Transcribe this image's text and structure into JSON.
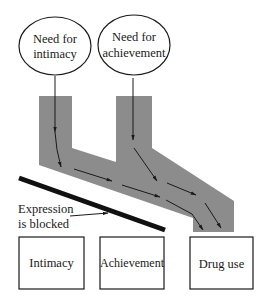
{
  "diagram": {
    "type": "flow",
    "colors": {
      "channel": "#8c8c8c",
      "stroke": "#1a1a1a",
      "barrier": "#111111",
      "background": "#ffffff"
    },
    "needs": [
      {
        "id": "need-intimacy",
        "line1": "Need for",
        "line2": "intimacy"
      },
      {
        "id": "need-achievement",
        "line1": "Need for",
        "line2": "achievement"
      }
    ],
    "barrier": {
      "label_line1": "Expression",
      "label_line2": "is blocked"
    },
    "outcomes": [
      {
        "id": "outcome-intimacy",
        "label": "Intimacy"
      },
      {
        "id": "outcome-achievement",
        "label": "Achievement"
      },
      {
        "id": "outcome-drug-use",
        "label": "Drug use"
      }
    ],
    "edges": [
      {
        "from": "Need for intimacy",
        "to": "Drug use",
        "via": "grey channel"
      },
      {
        "from": "Need for achievement",
        "to": "Drug use",
        "via": "grey channel"
      },
      {
        "from": "Expression is blocked",
        "to": "barrier bar"
      }
    ]
  }
}
